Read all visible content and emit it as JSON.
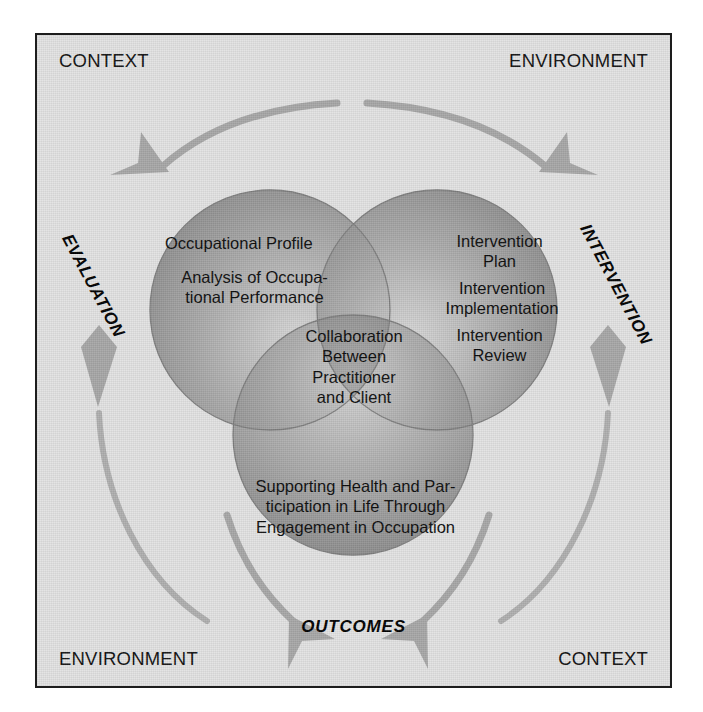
{
  "figure": {
    "corner_labels": {
      "top_left": "CONTEXT",
      "top_right": "ENVIRONMENT",
      "bottom_left": "ENVIRONMENT",
      "bottom_right": "CONTEXT"
    },
    "process_labels": {
      "left": "EVALUATION",
      "right": "INTERVENTION",
      "bottom": "OUTCOMES"
    },
    "circles": [
      {
        "id": "evaluation-circle",
        "position": "top-left",
        "items": [
          "Occupational Profile",
          "Analysis of Occupa-\ntional Performance"
        ]
      },
      {
        "id": "intervention-circle",
        "position": "top-right",
        "items": [
          "Intervention\nPlan",
          "Intervention\nImplementation",
          "Intervention\nReview"
        ]
      },
      {
        "id": "outcomes-circle",
        "position": "bottom",
        "items": [
          "Supporting Health and Par-\nticipation in Life Through\nEngagement in Occupation"
        ]
      },
      {
        "id": "intersection-center",
        "position": "center",
        "items": [
          "Collaboration\nBetween\nPractitioner\nand Client"
        ]
      }
    ],
    "texts": {
      "occupational_profile": "Occupational Profile",
      "analysis": "Analysis of Occupa-\ntional Performance",
      "intervention_plan": "Intervention\nPlan",
      "intervention_implementation": "Intervention\nImplementation",
      "intervention_review": "Intervention\nReview",
      "collaboration": "Collaboration\nBetween\nPractitioner\nand Client",
      "supporting": "Supporting Health and Par-\nticipation in Life Through\nEngagement in Occupation"
    },
    "arrows": [
      {
        "name": "arrow-top-left",
        "direction": "down-left",
        "meaning": "context-into-evaluation"
      },
      {
        "name": "arrow-top-right",
        "direction": "down-right",
        "meaning": "environment-into-intervention"
      },
      {
        "name": "arrow-left-up",
        "direction": "up",
        "meaning": "evaluation-cycle"
      },
      {
        "name": "arrow-right-up",
        "direction": "up",
        "meaning": "intervention-cycle"
      },
      {
        "name": "arrow-bottom-left",
        "direction": "down-right",
        "meaning": "toward-outcomes-left"
      },
      {
        "name": "arrow-bottom-right",
        "direction": "down-left",
        "meaning": "toward-outcomes-right"
      }
    ],
    "colors": {
      "background": "#e3e3e3",
      "frame_border": "#1d1d1d",
      "circle_fill": "#9a9a9a",
      "circle_fill_light": "#c9c9c9",
      "circle_stroke": "#7d7d7d",
      "arrow_fill": "#a9a9a9",
      "text": "#0d0d0d"
    }
  }
}
